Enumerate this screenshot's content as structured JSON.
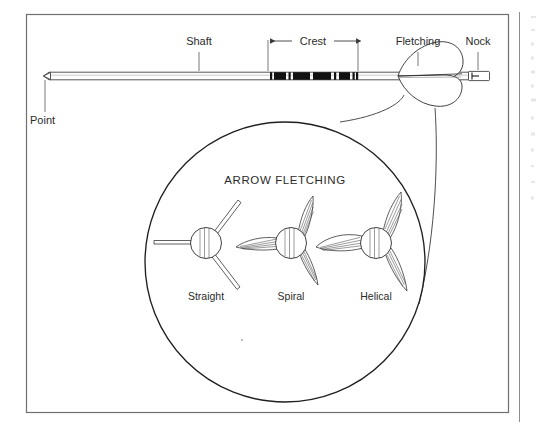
{
  "figure": {
    "frame": {
      "visible": true,
      "color": "#6f6f6f"
    },
    "arrow_labels": [
      {
        "id": "point",
        "text": "Point",
        "x": 30,
        "y": 124
      },
      {
        "id": "shaft",
        "text": "Shaft",
        "x": 187,
        "y": 45
      },
      {
        "id": "crest",
        "text": "Crest",
        "x": 303,
        "y": 45
      },
      {
        "id": "fletching",
        "text": "Fletching",
        "x": 394,
        "y": 45
      },
      {
        "id": "nock",
        "text": "Nock",
        "x": 473,
        "y": 45
      }
    ],
    "inset": {
      "title": "ARROW FLETCHING",
      "title_x": 285,
      "title_y": 184,
      "circle": {
        "cx": 285,
        "cy": 262,
        "r": 140
      },
      "types": [
        {
          "id": "straight",
          "label": "Straight",
          "cx": 206,
          "cy": 243,
          "label_x": 206,
          "label_y": 300
        },
        {
          "id": "spiral",
          "label": "Spiral",
          "cx": 291,
          "cy": 243,
          "label_x": 291,
          "label_y": 300
        },
        {
          "id": "helical",
          "label": "Helical",
          "cx": 376,
          "cy": 243,
          "label_x": 376,
          "label_y": 300
        }
      ]
    },
    "crest_bands": {
      "count": 5,
      "color": "#111111",
      "segments": [
        {
          "x": 274,
          "w": 12
        },
        {
          "x": 291,
          "w": 17
        },
        {
          "x": 313,
          "w": 18
        },
        {
          "x": 336,
          "w": 5
        },
        {
          "x": 345,
          "w": 11
        }
      ]
    },
    "colors": {
      "ink": "#2b2b2b",
      "frame": "#6f6f6f",
      "leader": "#6a6a6a",
      "crest": "#111111",
      "background": "#ffffff"
    }
  }
}
